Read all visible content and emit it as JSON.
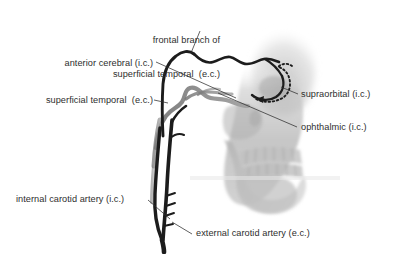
{
  "figure": {
    "background_color": "#ffffff",
    "text_color": "#2e2e2e",
    "artery_dark_color": "#1c1c1c",
    "artery_gray_color": "#8f8f8f",
    "skull_color": "#b9b9b9"
  },
  "labels": {
    "frontal_branch": {
      "line1": "frontal branch of",
      "line2": "superficial temporal  (e.c.)"
    },
    "anterior_cerebral": "anterior cerebral (i.c.)",
    "superficial_temporal": "superficial temporal  (e.c.)",
    "supraorbital": "supraorbital (i.c.)",
    "ophthalmic": "ophthalmic (i.c.)",
    "internal_carotid": "internal carotid artery (i.c.)",
    "external_carotid": "external carotid artery (e.c.)"
  }
}
